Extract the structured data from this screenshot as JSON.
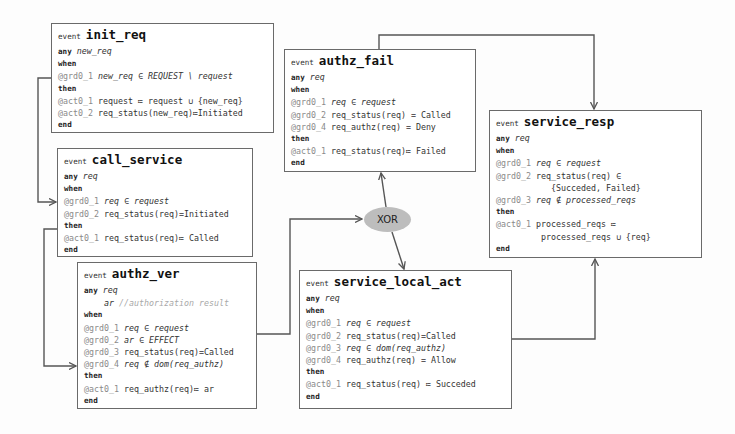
{
  "diagram": {
    "gateway": {
      "label": "XOR"
    },
    "events": {
      "init_req": {
        "keyword": "event",
        "name": "init_req",
        "any": "any",
        "params": [
          "new_req"
        ],
        "when": "when",
        "guards": [
          {
            "label": "@grd0_1",
            "expr": "new_req ∈ REQUEST \\ request"
          }
        ],
        "then": "then",
        "actions": [
          {
            "label": "@act0_1",
            "expr": "request ≔ request ∪ {new_req}"
          },
          {
            "label": "@act0_2",
            "expr": "req_status(new_req)≔Initiated"
          }
        ],
        "end": "end"
      },
      "call_service": {
        "keyword": "event",
        "name": "call_service",
        "any": "any",
        "params": [
          "req"
        ],
        "when": "when",
        "guards": [
          {
            "label": "@grd0_1",
            "expr": "req ∈ request"
          },
          {
            "label": "@grd0_2",
            "expr": "req_status(req)=Initiated"
          }
        ],
        "then": "then",
        "actions": [
          {
            "label": "@act0_1",
            "expr": "req_status(req)≔ Called"
          }
        ],
        "end": "end"
      },
      "authz_ver": {
        "keyword": "event",
        "name": "authz_ver",
        "any": "any",
        "params": [
          "req"
        ],
        "extra_param": "ar",
        "extra_param_comment": "//authorization result",
        "when": "when",
        "guards": [
          {
            "label": "@grd0_1",
            "expr": "req ∈ request"
          },
          {
            "label": "@grd0_2",
            "expr": "ar ∈ EFFECT"
          },
          {
            "label": "@grd0_3",
            "expr": "req_status(req)=Called"
          },
          {
            "label": "@grd0_4",
            "expr": "req ∉ dom(req_authz)"
          }
        ],
        "then": "then",
        "actions": [
          {
            "label": "@act0_1",
            "expr": "req_authz(req)≔ ar"
          }
        ],
        "end": "end"
      },
      "authz_fail": {
        "keyword": "event",
        "name": "authz_fail",
        "any": "any",
        "params": [
          "req"
        ],
        "when": "when",
        "guards": [
          {
            "label": "@grd0_1",
            "expr": "req ∈ request"
          },
          {
            "label": "@grd0_2",
            "expr": "req_status(req) = Called"
          },
          {
            "label": "@grd0_4",
            "expr": "req_authz(req) = Deny"
          }
        ],
        "then": "then",
        "actions": [
          {
            "label": "@act0_1",
            "expr": "req_status(req)≔ Failed"
          }
        ],
        "end": "end"
      },
      "service_local_act": {
        "keyword": "event",
        "name": "service_local_act",
        "any": "any",
        "params": [
          "req"
        ],
        "when": "when",
        "guards": [
          {
            "label": "@grd0_1",
            "expr": "req ∈ request"
          },
          {
            "label": "@grd0_2",
            "expr": "req_status(req)=Called"
          },
          {
            "label": "@grd0_3",
            "expr": "req ∈ dom(req_authz)"
          },
          {
            "label": "@grd0_4",
            "expr": "req_authz(req) = Allow"
          }
        ],
        "then": "then",
        "actions": [
          {
            "label": "@act0_1",
            "expr": "req_status(req) ≔ Succeded"
          }
        ],
        "end": "end"
      },
      "service_resp": {
        "keyword": "event",
        "name": "service_resp",
        "any": "any",
        "params": [
          "req"
        ],
        "when": "when",
        "guards": [
          {
            "label": "@grd0_1",
            "expr": "req ∈ request"
          },
          {
            "label": "@grd0_2",
            "expr": "req_status(req) ∈"
          },
          {
            "label": "",
            "expr": "           {Succeded, Failed}"
          },
          {
            "label": "@grd0_3",
            "expr": "req ∉ processed_reqs"
          }
        ],
        "then": "then",
        "actions": [
          {
            "label": "@act0_1",
            "expr": "processed_reqs ≔"
          },
          {
            "label": "",
            "expr": "         processed_reqs ∪ {req}"
          }
        ],
        "end": "end"
      }
    },
    "edges": [
      {
        "from": "init_req",
        "to": "call_service"
      },
      {
        "from": "call_service",
        "to": "authz_ver"
      },
      {
        "from": "authz_ver",
        "to": "XOR"
      },
      {
        "from": "XOR",
        "to": "authz_fail"
      },
      {
        "from": "XOR",
        "to": "service_local_act"
      },
      {
        "from": "authz_fail",
        "to": "service_resp"
      },
      {
        "from": "service_local_act",
        "to": "service_resp"
      }
    ],
    "colors": {
      "border": "#6a6a6a",
      "gateway_fill": "#bdbdbd",
      "label_gray": "#8a8a8a"
    }
  }
}
